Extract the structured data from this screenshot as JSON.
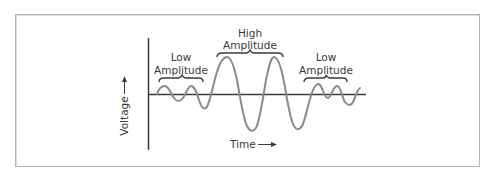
{
  "diagram": {
    "y_axis_label": "Voltage",
    "x_axis_label": "Time",
    "regions": [
      {
        "label_line1": "Low",
        "label_line2": "Amplitude",
        "level": "low"
      },
      {
        "label_line1": "High",
        "label_line2": "Amplitude",
        "level": "high"
      },
      {
        "label_line1": "Low",
        "label_line2": "Amplitude",
        "level": "low"
      }
    ],
    "colors": {
      "frame_border": "#b4b4b4",
      "axis": "#3a3a3a",
      "wave": "#8a8a8a",
      "text": "#3a3a3a",
      "background": "#ffffff"
    }
  }
}
